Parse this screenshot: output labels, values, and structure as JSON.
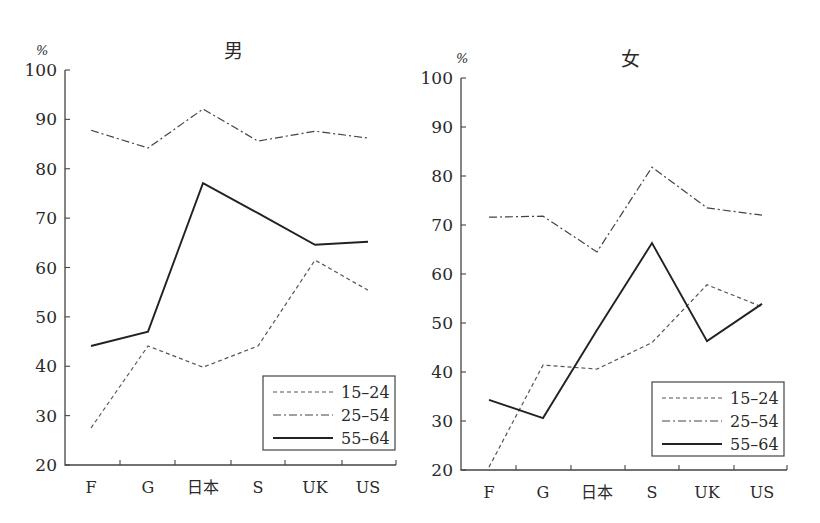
{
  "chart_data": [
    {
      "type": "line",
      "title": "男",
      "ylabel": "%",
      "xlabel": "",
      "ylim": [
        20,
        100
      ],
      "yticks": [
        20,
        30,
        40,
        50,
        60,
        70,
        80,
        90,
        100
      ],
      "categories": [
        "F",
        "G",
        "日本",
        "S",
        "UK",
        "US"
      ],
      "grid": false,
      "legend_position": "lower right",
      "series": [
        {
          "name": "15–24",
          "style": "dashed",
          "values": [
            27.5,
            44.1,
            39.8,
            44.1,
            61.5,
            55.4
          ]
        },
        {
          "name": "25–54",
          "style": "dashdot",
          "values": [
            87.8,
            84.2,
            92.1,
            85.6,
            87.6,
            86.2
          ]
        },
        {
          "name": "55–64",
          "style": "solid",
          "values": [
            44.1,
            47.0,
            77.1,
            71.0,
            64.6,
            65.2
          ]
        }
      ]
    },
    {
      "type": "line",
      "title": "女",
      "ylabel": "%",
      "xlabel": "",
      "ylim": [
        20,
        100
      ],
      "yticks": [
        20,
        30,
        40,
        50,
        60,
        70,
        80,
        90,
        100
      ],
      "categories": [
        "F",
        "G",
        "日本",
        "S",
        "UK",
        "US"
      ],
      "grid": false,
      "legend_position": "lower right",
      "series": [
        {
          "name": "15–24",
          "style": "dashed",
          "values": [
            20.6,
            41.4,
            40.6,
            46.0,
            57.8,
            53.3
          ]
        },
        {
          "name": "25–54",
          "style": "dashdot",
          "values": [
            71.6,
            71.8,
            64.5,
            81.8,
            73.5,
            72.0
          ]
        },
        {
          "name": "55–64",
          "style": "solid",
          "values": [
            34.3,
            30.6,
            48.6,
            66.3,
            46.3,
            53.9
          ]
        }
      ]
    }
  ]
}
